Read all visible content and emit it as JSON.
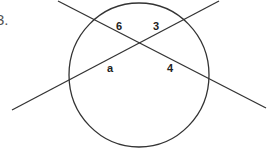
{
  "problem": {
    "number_label": "3."
  },
  "diagram": {
    "type": "intersecting-chords-in-circle",
    "circle": {
      "cx": 139,
      "cy": 75,
      "rx": 70,
      "ry": 72,
      "stroke": "#333333"
    },
    "lines": [
      {
        "name": "chord-descending",
        "x1": 58,
        "y1": 1,
        "x2": 266,
        "y2": 108
      },
      {
        "name": "chord-ascending",
        "x1": 12,
        "y1": 110,
        "x2": 219,
        "y2": 1
      }
    ],
    "segment_labels": [
      {
        "id": "upper-left",
        "text": "6",
        "x": 116,
        "y": 30
      },
      {
        "id": "upper-right",
        "text": "3",
        "x": 153,
        "y": 30
      },
      {
        "id": "lower-left",
        "text": "a",
        "x": 107,
        "y": 72
      },
      {
        "id": "lower-right",
        "text": "4",
        "x": 167,
        "y": 72
      }
    ]
  }
}
